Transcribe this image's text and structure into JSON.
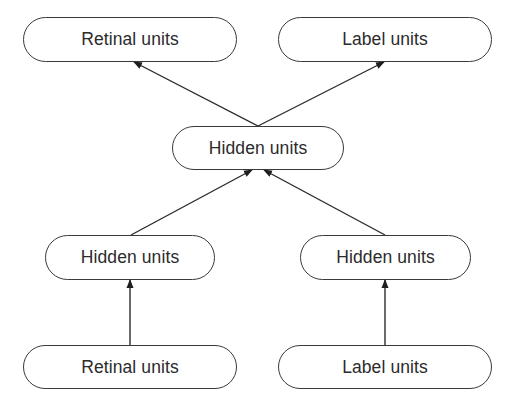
{
  "diagram": {
    "nodes": [
      {
        "id": "retinal-top",
        "label": "Retinal units",
        "x": 23,
        "y": 17,
        "w": 214,
        "h": 45
      },
      {
        "id": "label-top",
        "label": "Label units",
        "x": 278,
        "y": 17,
        "w": 214,
        "h": 45
      },
      {
        "id": "hidden-center",
        "label": "Hidden units",
        "x": 172,
        "y": 126,
        "w": 172,
        "h": 44
      },
      {
        "id": "hidden-left",
        "label": "Hidden units",
        "x": 45,
        "y": 235,
        "w": 170,
        "h": 45
      },
      {
        "id": "hidden-right",
        "label": "Hidden units",
        "x": 300,
        "y": 235,
        "w": 171,
        "h": 45
      },
      {
        "id": "retinal-bottom",
        "label": "Retinal units",
        "x": 23,
        "y": 345,
        "w": 214,
        "h": 44
      },
      {
        "id": "label-bottom",
        "label": "Label units",
        "x": 278,
        "y": 345,
        "w": 214,
        "h": 44
      }
    ],
    "edges": [
      {
        "from": "hidden-center",
        "to": "retinal-top",
        "x1": 258,
        "y1": 126,
        "x2": 134,
        "y2": 62
      },
      {
        "from": "hidden-center",
        "to": "label-top",
        "x1": 258,
        "y1": 126,
        "x2": 384,
        "y2": 62
      },
      {
        "from": "hidden-left",
        "to": "hidden-center",
        "x1": 131,
        "y1": 235,
        "x2": 252,
        "y2": 170
      },
      {
        "from": "hidden-right",
        "to": "hidden-center",
        "x1": 385,
        "y1": 235,
        "x2": 264,
        "y2": 170
      },
      {
        "from": "retinal-bottom",
        "to": "hidden-left",
        "x1": 130,
        "y1": 345,
        "x2": 130,
        "y2": 280
      },
      {
        "from": "label-bottom",
        "to": "hidden-right",
        "x1": 385,
        "y1": 345,
        "x2": 385,
        "y2": 280
      }
    ],
    "line_color": "#2b2b2b"
  }
}
